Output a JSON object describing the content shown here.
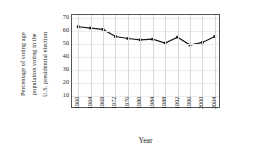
{
  "chart_data": {
    "type": "line",
    "title": "",
    "xlabel": "Year",
    "ylabel": "Percentage of voting age population voting in the U.S. presidential election",
    "ylabel_lines": [
      "Percentage of voting age",
      "population voting in the",
      "U.S. presidential election"
    ],
    "categories": [
      "1960",
      "1964",
      "1968",
      "1972",
      "1976",
      "1980",
      "1984",
      "1988",
      "1992",
      "1996",
      "2000",
      "2004"
    ],
    "values": [
      63,
      62,
      61,
      55.5,
      54,
      53,
      53.5,
      50.5,
      55,
      49,
      51,
      55.5
    ],
    "ylim": [
      0,
      72
    ],
    "yticks": [
      10,
      20,
      30,
      40,
      50,
      60,
      70
    ],
    "ytick_labels": [
      "10",
      "20",
      "30",
      "40",
      "50",
      "60",
      "70"
    ],
    "grid": "vertical-and-light-horizontal",
    "legend": "none",
    "series": [
      {
        "name": "Voter turnout",
        "values": [
          63,
          62,
          61,
          55.5,
          54,
          53,
          53.5,
          50.5,
          55,
          49,
          51,
          55.5
        ],
        "color": "#1a1a1a",
        "marker": "square",
        "line_width": 1.2
      }
    ]
  },
  "colors": {
    "line": "#1a1a1a",
    "marker": "#111111",
    "frame": "#555555",
    "grid_vertical": "#d9d9d9",
    "grid_horizontal": "#ececec",
    "background": "#ffffff"
  }
}
